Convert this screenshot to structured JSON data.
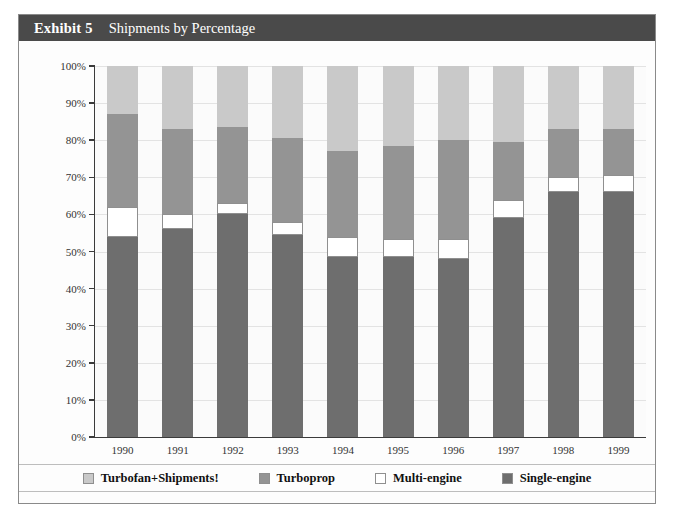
{
  "header": {
    "exhibit_label": "Exhibit 5",
    "title": "Shipments by Percentage"
  },
  "colors": {
    "turbofan": "#c9c9c9",
    "turboprop": "#949494",
    "multi_engine": "#ffffff",
    "single_engine": "#6e6e6e",
    "header_band": "#4a4a4a",
    "axis": "#3b3b3b",
    "grid": "#e3e3e3"
  },
  "legend": {
    "items": [
      {
        "label": "Turbofan+Shipments!",
        "color": "#c9c9c9",
        "swatch": "turbofan-swatch"
      },
      {
        "label": "Turboprop",
        "color": "#949494",
        "swatch": "turboprop-swatch"
      },
      {
        "label": "Multi-engine",
        "color": "#ffffff",
        "swatch": "multi-engine-swatch"
      },
      {
        "label": "Single-engine",
        "color": "#6e6e6e",
        "swatch": "single-engine-swatch"
      }
    ]
  },
  "chart_data": {
    "type": "bar",
    "stacked": true,
    "title": "Shipments by Percentage",
    "xlabel": "",
    "ylabel": "",
    "ylim": [
      0,
      100
    ],
    "yticks": [
      0,
      10,
      20,
      30,
      40,
      50,
      60,
      70,
      80,
      90,
      100
    ],
    "ytick_labels": [
      "0%",
      "10%",
      "20%",
      "30%",
      "40%",
      "50%",
      "60%",
      "70%",
      "80%",
      "90%",
      "100%"
    ],
    "grid": true,
    "legend_position": "bottom",
    "categories": [
      "1990",
      "1991",
      "1992",
      "1993",
      "1994",
      "1995",
      "1996",
      "1997",
      "1998",
      "1999"
    ],
    "series": [
      {
        "name": "Single-engine",
        "color": "#6e6e6e",
        "values": [
          54,
          56,
          60,
          54.5,
          48.5,
          48.5,
          48,
          59,
          66,
          66
        ]
      },
      {
        "name": "Multi-engine",
        "color": "#ffffff",
        "values": [
          8,
          4,
          3,
          3.5,
          5.5,
          5,
          5.5,
          5,
          4,
          4.5
        ]
      },
      {
        "name": "Turboprop",
        "color": "#949494",
        "values": [
          25,
          23,
          20.5,
          22.5,
          23,
          25,
          26.5,
          15.5,
          13,
          12.5
        ]
      },
      {
        "name": "Turbofan+Shipments!",
        "color": "#c9c9c9",
        "values": [
          13,
          17,
          16.5,
          19.5,
          23,
          21.5,
          20,
          20.5,
          17,
          17
        ]
      }
    ]
  }
}
